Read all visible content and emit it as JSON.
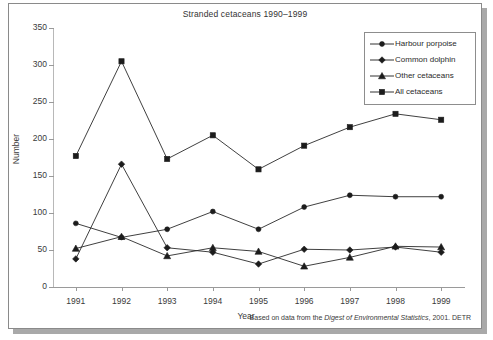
{
  "figure": {
    "title": "Stranded cetaceans 1990–1999",
    "source_note_prefix": "Based on data from the ",
    "source_note_italic": "Digest of Environmental Statistics",
    "source_note_suffix": ", 2001. DETR"
  },
  "chart_data": {
    "type": "line",
    "title": "Stranded cetaceans 1990–1999",
    "xlabel": "Year",
    "ylabel": "Number",
    "categories": [
      "1991",
      "1992",
      "1993",
      "1994",
      "1995",
      "1996",
      "1997",
      "1998",
      "1999"
    ],
    "ylim": [
      0,
      350
    ],
    "yticks": [
      0,
      50,
      100,
      150,
      200,
      250,
      300,
      350
    ],
    "grid": false,
    "legend_position": "top-right",
    "series": [
      {
        "name": "Harbour porpoise",
        "marker": "circle",
        "color": "#1c1c1c",
        "values": [
          86,
          67,
          78,
          102,
          78,
          108,
          124,
          122,
          122
        ]
      },
      {
        "name": "Common dolphin",
        "marker": "diamond",
        "color": "#1c1c1c",
        "values": [
          38,
          166,
          53,
          47,
          31,
          51,
          50,
          54,
          47
        ]
      },
      {
        "name": "Other cetaceans",
        "marker": "triangle",
        "color": "#1c1c1c",
        "values": [
          52,
          68,
          42,
          53,
          48,
          28,
          40,
          55,
          54
        ]
      },
      {
        "name": "All cetaceans",
        "marker": "square",
        "color": "#1c1c1c",
        "values": [
          177,
          305,
          173,
          205,
          159,
          191,
          216,
          234,
          226
        ]
      }
    ]
  }
}
